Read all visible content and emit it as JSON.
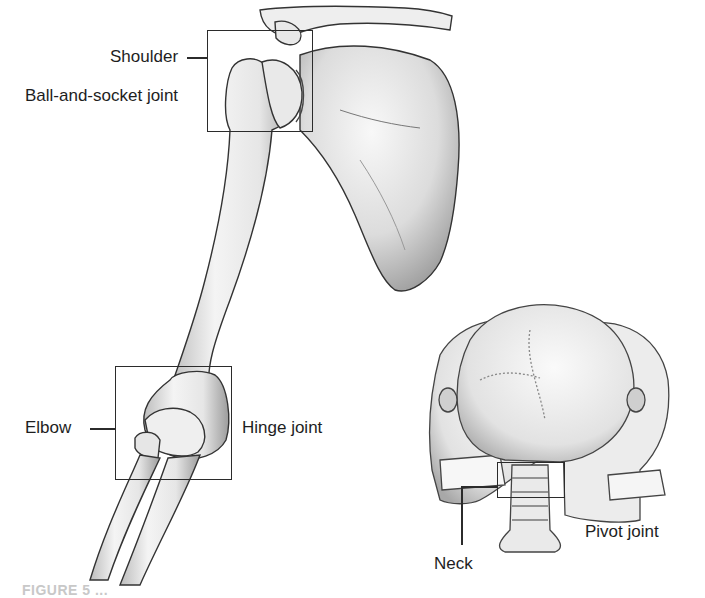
{
  "figure": {
    "type": "anatomical-diagram",
    "caption_partial": "FIGURE 5 ..."
  },
  "joints": [
    {
      "id": "shoulder",
      "location_label": "Shoulder",
      "joint_type_label": "Ball-and-socket joint"
    },
    {
      "id": "elbow",
      "location_label": "Elbow",
      "joint_type_label": "Hinge joint"
    },
    {
      "id": "neck",
      "location_label": "Neck",
      "joint_type_label": "Pivot joint"
    }
  ],
  "colors": {
    "background": "#ffffff",
    "ink": "#1e1e1e",
    "bone_fill": "#f2f2f2",
    "bone_shade": "#9a9a9a"
  }
}
